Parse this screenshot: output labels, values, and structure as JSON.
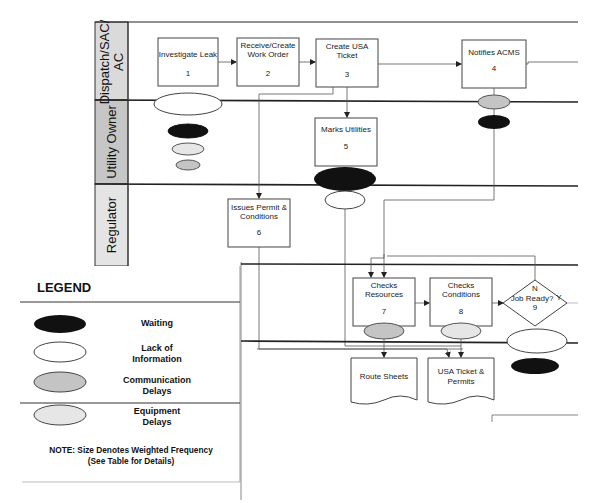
{
  "colors": {
    "waiting": "#111111",
    "lack_of_information": "#ffffff",
    "communication_delays": "#c4c4c4",
    "equipment_delays": "#e6e6e6",
    "lane_header": "#d9d9d9",
    "lane_header_utility": "#c9c9c9",
    "line": "#333333"
  },
  "lanes": [
    {
      "label": "Dispatch/SAC/",
      "label2": "AC"
    },
    {
      "label": "Utility Owner"
    },
    {
      "label": "Regulator"
    }
  ],
  "process_boxes": [
    {
      "id": "1",
      "line1": "Investigate Leak",
      "line2": "",
      "number": "1"
    },
    {
      "id": "2",
      "line1": "Receive/Create",
      "line2": "Work Order",
      "number": "2"
    },
    {
      "id": "3",
      "line1": "Create USA",
      "line2": "Ticket",
      "number": "3"
    },
    {
      "id": "4",
      "line1": "Notifies ACMS",
      "line2": "",
      "number": "4"
    },
    {
      "id": "5",
      "line1": "Marks Utilities",
      "line2": "",
      "number": "5"
    },
    {
      "id": "6",
      "line1": "Issues Permit &",
      "line2": "Conditions",
      "number": "6"
    },
    {
      "id": "7",
      "line1": "Checks",
      "line2": "Resources",
      "number": "7"
    },
    {
      "id": "8",
      "line1": "Checks",
      "line2": "Conditions",
      "number": "8"
    }
  ],
  "decision": {
    "label": "Job Ready?",
    "number": "9",
    "no_label": "N",
    "yes_label": "Y"
  },
  "documents": [
    {
      "line1": "Route Sheets",
      "line2": ""
    },
    {
      "line1": "USA Ticket &",
      "line2": "Permits"
    }
  ],
  "legend": {
    "title": "LEGEND",
    "items": [
      {
        "type": "waiting",
        "line1": "Waiting",
        "line2": ""
      },
      {
        "type": "lack_of_information",
        "line1": "Lack of",
        "line2": "Information"
      },
      {
        "type": "communication_delays",
        "line1": "Communication",
        "line2": "Delays"
      },
      {
        "type": "equipment_delays",
        "line1": "Equipment",
        "line2": "Delays"
      }
    ],
    "note_line1": "NOTE: Size Denotes Weighted Frequency",
    "note_line2": "(See Table for Details)"
  }
}
